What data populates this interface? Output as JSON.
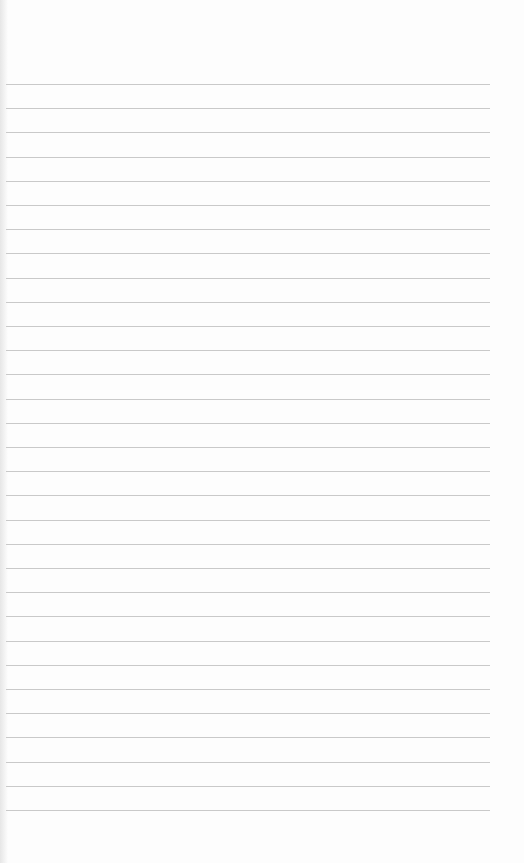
{
  "page": {
    "type": "blank lined paper",
    "line_count": 31,
    "first_line_y": 84,
    "line_spacing": 24.2,
    "line_left": 6,
    "line_width": 484,
    "line_color": "#c9c9c9",
    "background_color": "#fdfdfd"
  }
}
